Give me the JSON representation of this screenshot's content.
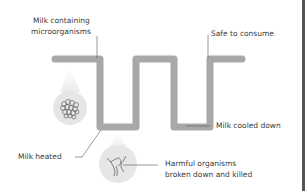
{
  "diagram": {
    "type": "pasteurization-process",
    "labels": {
      "start": [
        "Milk containing",
        "microorganisms"
      ],
      "end": "Safe to consume",
      "heated": "Milk heated",
      "cooled": "Milk cooled down",
      "killed": [
        "Harmful organisms",
        "broken down and killed"
      ]
    },
    "icons": {
      "microorganisms": "microorganism-cluster-icon",
      "broken": "broken-organism-icon"
    },
    "colors": {
      "pipe": "#a8a8a8",
      "circle": "#e6e6e6",
      "text": "#3a3a3a",
      "leader": "#555555",
      "border": "#555555"
    }
  }
}
